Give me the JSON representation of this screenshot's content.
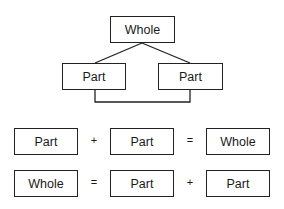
{
  "tree": {
    "root": {
      "label": "Whole"
    },
    "children": [
      {
        "label": "Part"
      },
      {
        "label": "Part"
      }
    ]
  },
  "equations": [
    {
      "terms": [
        "Part",
        "Part",
        "Whole"
      ],
      "operators": [
        "+",
        "="
      ]
    },
    {
      "terms": [
        "Whole",
        "Part",
        "Part"
      ],
      "operators": [
        "=",
        "+"
      ]
    }
  ]
}
